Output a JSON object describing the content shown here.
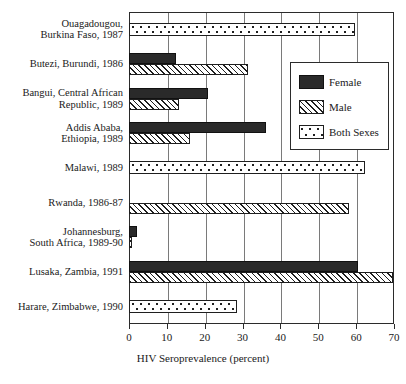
{
  "chart_data": {
    "type": "bar",
    "orientation": "horizontal",
    "title": "",
    "xlabel": "HIV Seroprevalence (percent)",
    "ylabel": "",
    "xlim": [
      0,
      70
    ],
    "xticks": [
      0,
      10,
      20,
      30,
      40,
      50,
      60,
      70
    ],
    "xticklabels": [
      "0",
      "10",
      "20",
      "30",
      "40",
      "50",
      "60",
      "70"
    ],
    "grid": "vertical",
    "legend_position": "upper right",
    "categories": [
      "Ouagadougou, Burkina Faso, 1987",
      "Butezi, Burundi, 1986",
      "Bangui, Central African Republic, 1989",
      "Addis Ababa, Ethiopia, 1989",
      "Malawi, 1989",
      "Rwanda, 1986-87",
      "Johannesburg, South Africa, 1989-90",
      "Lusaka, Zambia, 1991",
      "Harare, Zimbabwe, 1990"
    ],
    "series": [
      {
        "name": "Female",
        "key": "female",
        "values": [
          null,
          12.4,
          20.9,
          36.2,
          null,
          null,
          2.1,
          60.5,
          null
        ]
      },
      {
        "name": "Male",
        "key": "male",
        "values": [
          null,
          31.4,
          13.2,
          16.1,
          null,
          58.1,
          0.8,
          69.7,
          null
        ]
      },
      {
        "name": "Both Sexes",
        "key": "both",
        "values": [
          59.7,
          null,
          null,
          null,
          62.3,
          null,
          null,
          null,
          28.5
        ]
      }
    ]
  },
  "axis": {
    "xlabel": "HIV Seroprevalence (percent)",
    "tick_labels": [
      "0",
      "10",
      "20",
      "30",
      "40",
      "50",
      "60",
      "70"
    ]
  },
  "ylabels": [
    {
      "lines": [
        "Ouagadougou,",
        "Burkina Faso, 1987"
      ]
    },
    {
      "lines": [
        "Butezi, Burundi, 1986"
      ]
    },
    {
      "lines": [
        "Bangui, Central African",
        "Republic, 1989"
      ]
    },
    {
      "lines": [
        "Addis Ababa,",
        "Ethiopia, 1989"
      ]
    },
    {
      "lines": [
        "Malawi, 1989"
      ]
    },
    {
      "lines": [
        "Rwanda, 1986-87"
      ]
    },
    {
      "lines": [
        "Johannesburg,",
        "South Africa, 1989-90"
      ]
    },
    {
      "lines": [
        "Lusaka, Zambia, 1991"
      ]
    },
    {
      "lines": [
        "Harare, Zimbabwe, 1990"
      ]
    }
  ],
  "legend": {
    "items": [
      {
        "label": "Female",
        "swatch": "solid-black-swatch"
      },
      {
        "label": "Male",
        "swatch": "diagonal-hatch-swatch"
      },
      {
        "label": "Both Sexes",
        "swatch": "dotted-swatch"
      }
    ]
  },
  "colors": {
    "female": "#2a2a2a",
    "male_stroke": "#1f1f1f",
    "both_stroke": "#1f1f1f",
    "axis": "#2b2b2b",
    "grid": "#7a7a7a",
    "background": "#ffffff"
  }
}
